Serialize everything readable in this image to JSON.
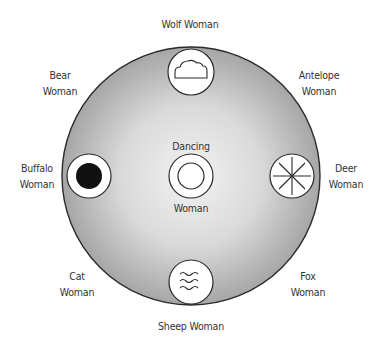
{
  "diagram": {
    "type": "circular arrangement",
    "center_figure": {
      "label_top": "Dancing",
      "label_bottom": "Woman",
      "symbol": "concentric-circles-icon"
    },
    "colors": {
      "outer_circle_fill_center": "#f2f2f2",
      "outer_circle_fill_edge": "#a8a8a8",
      "outline": "#2a2a2a",
      "symbol_fill": "#ffffff",
      "text": "#333333"
    },
    "figures": [
      {
        "position": "top",
        "line1": "Wolf Woman",
        "line2": "",
        "symbol": "cloud-icon"
      },
      {
        "position": "top-right",
        "line1": "Antelope",
        "line2": "Woman",
        "symbol": ""
      },
      {
        "position": "right",
        "line1": "Deer",
        "line2": "Woman",
        "symbol": "eight-point-star-icon"
      },
      {
        "position": "bottom-right",
        "line1": "Fox",
        "line2": "Woman",
        "symbol": ""
      },
      {
        "position": "bottom",
        "line1": "Sheep Woman",
        "line2": "",
        "symbol": "water-waves-icon"
      },
      {
        "position": "bottom-left",
        "line1": "Cat",
        "line2": "Woman",
        "symbol": ""
      },
      {
        "position": "left",
        "line1": "Buffalo",
        "line2": "Woman",
        "symbol": "black-dot-icon"
      },
      {
        "position": "top-left",
        "line1": "Bear",
        "line2": "Woman",
        "symbol": ""
      }
    ]
  }
}
